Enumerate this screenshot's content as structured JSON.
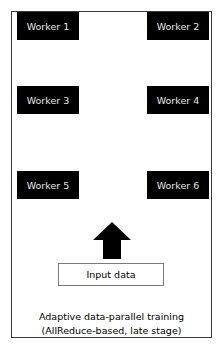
{
  "diagram": {
    "workers": [
      {
        "label": "Worker 1",
        "x": 17,
        "y": 12
      },
      {
        "label": "Worker 2",
        "x": 147,
        "y": 12
      },
      {
        "label": "Worker 3",
        "x": 17,
        "y": 86
      },
      {
        "label": "Worker 4",
        "x": 147,
        "y": 86
      },
      {
        "label": "Worker 5",
        "x": 17,
        "y": 171
      },
      {
        "label": "Worker 6",
        "x": 147,
        "y": 171
      }
    ],
    "arrow": {
      "direction": "up",
      "icon": "arrow-up-icon"
    },
    "input": {
      "label": "Input data"
    },
    "caption": {
      "line1": "Adaptive data-parallel training",
      "line2": "(AllReduce-based, late stage)"
    },
    "colors": {
      "worker_bg": "#000000",
      "worker_text": "#e8e8e8",
      "frame": "#3a3a3a"
    }
  }
}
